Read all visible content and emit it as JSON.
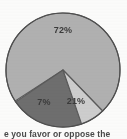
{
  "figure": {
    "type": "pie-chart-image",
    "background_color": "#fdfdfc"
  },
  "chart_data": {
    "type": "pie",
    "title": "",
    "subtitle": "",
    "xlabel": "",
    "ylabel": "",
    "legend_position": "none",
    "grid": false,
    "labels_on_slices": true,
    "categories": [
      "72%",
      "21%",
      "7%"
    ],
    "values": [
      72,
      21,
      7
    ],
    "colors": [
      "#b2b2b2",
      "#6f6f6f",
      "#cfcfcf"
    ],
    "slices": [
      {
        "label": "72%",
        "value": 72,
        "color": "#b2b2b2",
        "start_angle_deg": 147,
        "end_angle_deg": 406,
        "label_x": 63,
        "label_y": 31
      },
      {
        "label": "21%",
        "value": 21,
        "color": "#6f6f6f",
        "start_angle_deg": 71,
        "end_angle_deg": 146,
        "label_x": 76,
        "label_y": 102
      },
      {
        "label": "7%",
        "value": 7,
        "color": "#cfcfcf",
        "start_angle_deg": 46,
        "end_angle_deg": 71,
        "label_x": 44,
        "label_y": 103
      }
    ],
    "outline_color": "#5a5a5a",
    "center_x": 63,
    "center_y": 70,
    "radius": 57
  },
  "caption": {
    "text": "e you favor or oppose the",
    "truncated": true
  }
}
